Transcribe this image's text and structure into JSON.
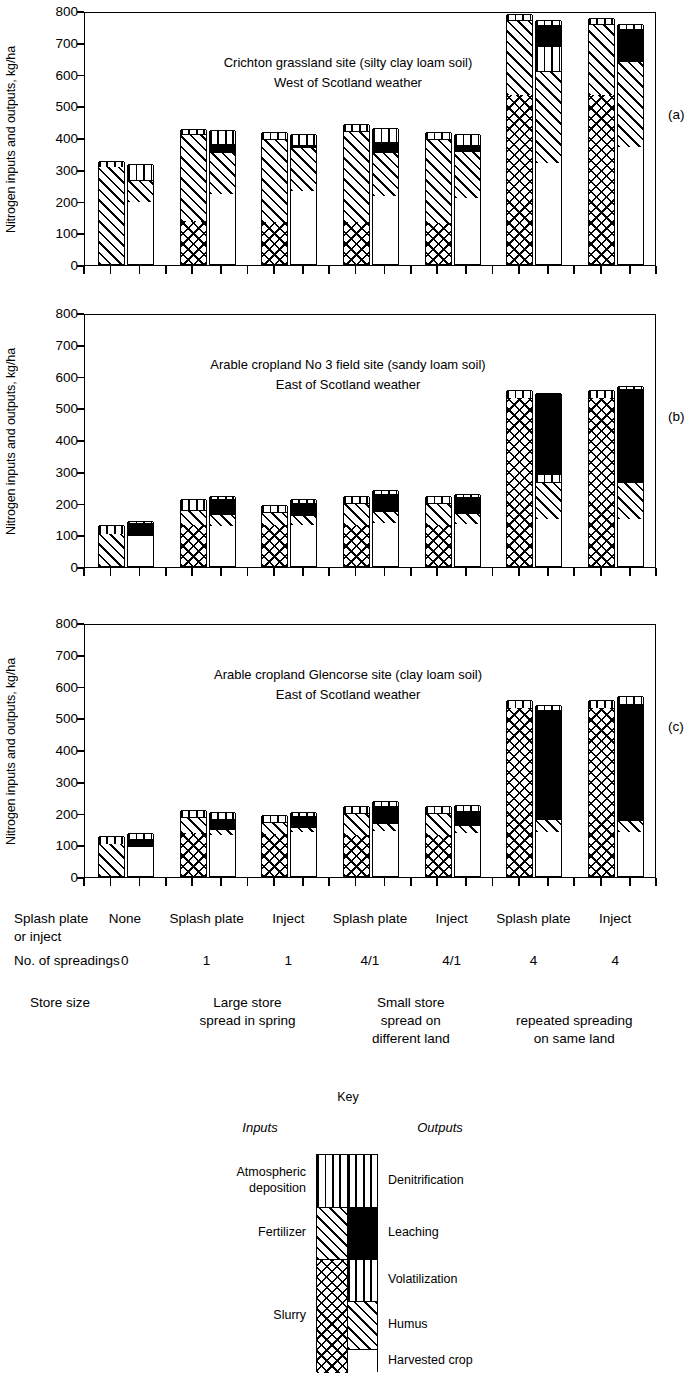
{
  "figure": {
    "ylabel": "Nitrogen inputs and outputs, kg/ha",
    "yticks": [
      "800",
      "700",
      "600",
      "500",
      "400",
      "300",
      "200",
      "100",
      "0"
    ],
    "panel_markers": [
      "(a)",
      "(b)",
      "(c)"
    ]
  },
  "panels": [
    {
      "marker": "(a)",
      "title_line1": "Crichton grassland site (silty clay loam soil)",
      "title_line2": "West of Scotland weather"
    },
    {
      "marker": "(b)",
      "title_line1": "Arable cropland No 3 field site (sandy loam soil)",
      "title_line2": "East of Scotland weather"
    },
    {
      "marker": "(c)",
      "title_line1": "Arable cropland Glencorse site (clay loam soil)",
      "title_line2": "East of Scotland weather"
    }
  ],
  "axis_rows": {
    "row1_label_line1": "Splash plate",
    "row1_label_line2": "or inject",
    "row1_values": [
      "None",
      "Splash plate",
      "Inject",
      "Splash plate",
      "Inject",
      "Splash plate",
      "Inject"
    ],
    "row2_label": "No. of spreadings",
    "row2_values": [
      "0",
      "1",
      "1",
      "4/1",
      "4/1",
      "4",
      "4"
    ],
    "row3_label": "Store size",
    "row3_groups": [
      {
        "line1": "Large store",
        "line2": "spread in spring"
      },
      {
        "line1": "Small store",
        "line2": "spread on",
        "line3": "different land"
      },
      {
        "line1": "",
        "line2": "repeated spreading",
        "line3": "on same land"
      }
    ]
  },
  "key": {
    "title": "Key",
    "inputs_heading": "Inputs",
    "outputs_heading": "Outputs",
    "inputs": [
      {
        "label_line1": "Atmospheric",
        "label_line2": "deposition",
        "fill": "vertical-lines"
      },
      {
        "label_line1": "Fertilizer",
        "label_line2": "",
        "fill": "diagonal-hatch"
      },
      {
        "label_line1": "Slurry",
        "label_line2": "",
        "fill": "cross-hatch"
      }
    ],
    "outputs": [
      {
        "label": "Denitrification",
        "fill": "vertical-lines"
      },
      {
        "label": "Leaching",
        "fill": "solid-black"
      },
      {
        "label": "Volatilization",
        "fill": "vertical-lines"
      },
      {
        "label": "Humus",
        "fill": "diagonal-hatch"
      },
      {
        "label": "Harvested crop",
        "fill": "white"
      }
    ]
  },
  "chart_data": {
    "type": "bar",
    "subtype": "grouped-stacked-paired",
    "ylabel": "Nitrogen inputs and outputs, kg/ha",
    "ylim": [
      0,
      800
    ],
    "ytick_step": 100,
    "grid": false,
    "legend_position": "below-figure",
    "categories": [
      "None",
      "Splash plate",
      "Inject",
      "Splash plate",
      "Inject",
      "Splash plate",
      "Inject"
    ],
    "category_spreadings": [
      "0",
      "1",
      "1",
      "4/1",
      "4/1",
      "4",
      "4"
    ],
    "input_series": [
      "Slurry",
      "Fertilizer",
      "Atmospheric deposition"
    ],
    "output_series": [
      "Harvested crop",
      "Humus",
      "Volatilization",
      "Leaching",
      "Denitrification"
    ],
    "panels": [
      {
        "id": "a",
        "site": "Crichton grassland site (silty clay loam soil)",
        "weather": "West of Scotland weather",
        "inputs": [
          {
            "Slurry": 0,
            "Fertilizer": 305,
            "Atmospheric deposition": 20
          },
          {
            "Slurry": 135,
            "Fertilizer": 275,
            "Atmospheric deposition": 15
          },
          {
            "Slurry": 133,
            "Fertilizer": 262,
            "Atmospheric deposition": 22
          },
          {
            "Slurry": 133,
            "Fertilizer": 287,
            "Atmospheric deposition": 20
          },
          {
            "Slurry": 130,
            "Fertilizer": 265,
            "Atmospheric deposition": 22
          },
          {
            "Slurry": 533,
            "Fertilizer": 237,
            "Atmospheric deposition": 18
          },
          {
            "Slurry": 533,
            "Fertilizer": 222,
            "Atmospheric deposition": 20
          }
        ],
        "outputs": [
          {
            "Harvested crop": 195,
            "Humus": 70,
            "Volatilization": 0,
            "Leaching": 0,
            "Denitrification": 50
          },
          {
            "Harvested crop": 222,
            "Humus": 130,
            "Volatilization": 0,
            "Leaching": 26,
            "Denitrification": 44
          },
          {
            "Harvested crop": 230,
            "Humus": 138,
            "Volatilization": 0,
            "Leaching": 8,
            "Denitrification": 35
          },
          {
            "Harvested crop": 213,
            "Humus": 140,
            "Volatilization": 0,
            "Leaching": 30,
            "Denitrification": 45
          },
          {
            "Harvested crop": 208,
            "Humus": 147,
            "Volatilization": 0,
            "Leaching": 20,
            "Denitrification": 33
          },
          {
            "Harvested crop": 318,
            "Humus": 289,
            "Volatilization": 81,
            "Leaching": 64,
            "Denitrification": 16
          },
          {
            "Harvested crop": 368,
            "Humus": 272,
            "Volatilization": 0,
            "Leaching": 100,
            "Denitrification": 15
          }
        ]
      },
      {
        "id": "b",
        "site": "Arable cropland No 3 field site (sandy loam soil)",
        "weather": "East of Scotland weather",
        "inputs": [
          {
            "Slurry": 0,
            "Fertilizer": 100,
            "Atmospheric deposition": 30
          },
          {
            "Slurry": 130,
            "Fertilizer": 48,
            "Atmospheric deposition": 32
          },
          {
            "Slurry": 128,
            "Fertilizer": 42,
            "Atmospheric deposition": 22
          },
          {
            "Slurry": 130,
            "Fertilizer": 70,
            "Atmospheric deposition": 22
          },
          {
            "Slurry": 130,
            "Fertilizer": 70,
            "Atmospheric deposition": 22
          },
          {
            "Slurry": 530,
            "Fertilizer": 0,
            "Atmospheric deposition": 25
          },
          {
            "Slurry": 530,
            "Fertilizer": 0,
            "Atmospheric deposition": 25
          }
        ],
        "outputs": [
          {
            "Harvested crop": 93,
            "Humus": 0,
            "Volatilization": 0,
            "Leaching": 42,
            "Denitrification": 7
          },
          {
            "Harvested crop": 125,
            "Humus": 40,
            "Volatilization": 0,
            "Leaching": 45,
            "Denitrification": 10
          },
          {
            "Harvested crop": 130,
            "Humus": 30,
            "Volatilization": 0,
            "Leaching": 40,
            "Denitrification": 10
          },
          {
            "Harvested crop": 135,
            "Humus": 38,
            "Volatilization": 0,
            "Leaching": 55,
            "Denitrification": 10
          },
          {
            "Harvested crop": 132,
            "Humus": 35,
            "Volatilization": 0,
            "Leaching": 50,
            "Denitrification": 10
          },
          {
            "Harvested crop": 148,
            "Humus": 117,
            "Volatilization": 25,
            "Leaching": 255,
            "Denitrification": 0
          },
          {
            "Harvested crop": 148,
            "Humus": 117,
            "Volatilization": 0,
            "Leaching": 293,
            "Denitrification": 9
          }
        ]
      },
      {
        "id": "c",
        "site": "Arable cropland Glencorse site (clay loam soil)",
        "weather": "East of Scotland weather",
        "inputs": [
          {
            "Slurry": 0,
            "Fertilizer": 100,
            "Atmospheric deposition": 25
          },
          {
            "Slurry": 135,
            "Fertilizer": 50,
            "Atmospheric deposition": 22
          },
          {
            "Slurry": 133,
            "Fertilizer": 38,
            "Atmospheric deposition": 20
          },
          {
            "Slurry": 130,
            "Fertilizer": 70,
            "Atmospheric deposition": 22
          },
          {
            "Slurry": 130,
            "Fertilizer": 70,
            "Atmospheric deposition": 22
          },
          {
            "Slurry": 528,
            "Fertilizer": 0,
            "Atmospheric deposition": 27
          },
          {
            "Slurry": 528,
            "Fertilizer": 0,
            "Atmospheric deposition": 27
          }
        ],
        "outputs": [
          {
            "Harvested crop": 90,
            "Humus": 0,
            "Volatilization": 0,
            "Leaching": 28,
            "Denitrification": 18
          },
          {
            "Harvested crop": 130,
            "Humus": 18,
            "Volatilization": 0,
            "Leaching": 32,
            "Denitrification": 22
          },
          {
            "Harvested crop": 140,
            "Humus": 15,
            "Volatilization": 0,
            "Leaching": 33,
            "Denitrification": 15
          },
          {
            "Harvested crop": 142,
            "Humus": 25,
            "Volatilization": 0,
            "Leaching": 55,
            "Denitrification": 15
          },
          {
            "Harvested crop": 135,
            "Humus": 25,
            "Volatilization": 0,
            "Leaching": 45,
            "Denitrification": 20
          },
          {
            "Harvested crop": 140,
            "Humus": 40,
            "Volatilization": 0,
            "Leaching": 342,
            "Denitrification": 18
          },
          {
            "Harvested crop": 140,
            "Humus": 35,
            "Volatilization": 0,
            "Leaching": 368,
            "Denitrification": 25
          }
        ]
      }
    ]
  }
}
